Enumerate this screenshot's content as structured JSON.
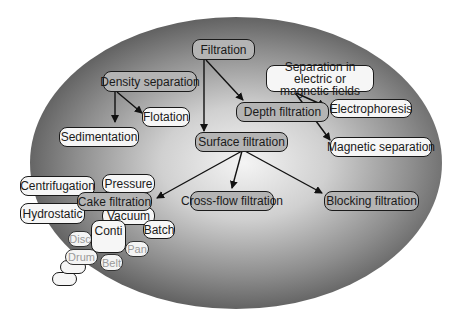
{
  "diagram": {
    "nodes": {
      "filtration": "Filtration",
      "density_separation": "Density separation",
      "flotation": "Flotation",
      "sedimentation": "Sedimentation",
      "depth_filtration": "Depth filtration",
      "separation_fields": "Separation in electric or magnetic fields",
      "electrophoresis": "Electrophoresis",
      "magnetic_separation": "Magnetic separation",
      "surface_filtration": "Surface filtration",
      "cross_flow_filtration": "Cross-flow filtration",
      "blocking_filtration": "Blocking filtration",
      "cake_filtration": "Cake filtration",
      "centrifugation": "Centrifugation",
      "pressure": "Pressure",
      "hydrostatic": "Hydrostatic",
      "vacuum": "Vacuum",
      "batch": "Batch",
      "conti": "Conti",
      "disc": "Disc",
      "pan": "Pan",
      "drum": "Drum",
      "belt": "Belt"
    },
    "edges": [
      {
        "from": "Filtration",
        "to": "Depth filtration"
      },
      {
        "from": "Filtration",
        "to": "Surface filtration"
      },
      {
        "from": "Density separation",
        "to": "Flotation"
      },
      {
        "from": "Density separation",
        "to": "Sedimentation"
      },
      {
        "from": "Separation in electric or magnetic fields",
        "to": "Electrophoresis"
      },
      {
        "from": "Separation in electric or magnetic fields",
        "to": "Magnetic separation"
      },
      {
        "from": "Surface filtration",
        "to": "Cake filtration"
      },
      {
        "from": "Surface filtration",
        "to": "Cross-flow filtration"
      },
      {
        "from": "Surface filtration",
        "to": "Blocking filtration"
      }
    ],
    "colors": {
      "node_gray": "#b4b4b4",
      "node_white": "#f6f6f6",
      "ellipse_dark": "#505050",
      "ellipse_light": "#f4f4f4"
    }
  }
}
